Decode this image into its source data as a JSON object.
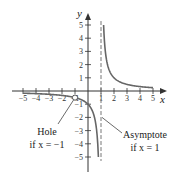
{
  "chart_data": {
    "type": "line",
    "title": "",
    "xlabel": "x",
    "ylabel": "y",
    "xlim": [
      -5.5,
      5.5
    ],
    "ylim": [
      -5.5,
      5.5
    ],
    "x_ticks": [
      -5,
      -4,
      -3,
      -2,
      -1,
      1,
      2,
      3,
      4,
      5
    ],
    "x_tick_labels": [
      "−5",
      "−4",
      "−3",
      "−2",
      "−1",
      "1",
      "2",
      "3",
      "4",
      "5"
    ],
    "y_ticks": [
      -5,
      -4,
      -3,
      -2,
      -1,
      1,
      2,
      3,
      4,
      5
    ],
    "y_tick_labels": [
      "−5",
      "−4",
      "−3",
      "−2",
      "−1",
      "1",
      "2",
      "3",
      "4",
      "5"
    ],
    "grid": false,
    "series": [
      {
        "name": "y = 1/(x − 1)",
        "branches": [
          {
            "x_range": [
              -5,
              0.8
            ],
            "note": "left branch, approaches −∞ as x → 1⁻"
          },
          {
            "x_range": [
              1.2,
              5
            ],
            "note": "right branch, approaches +∞ as x → 1⁺"
          }
        ]
      }
    ],
    "asymptote": {
      "x": 1,
      "style": "dashed"
    },
    "hole": {
      "x": -1,
      "y": -0.5
    },
    "annotations": [
      {
        "text_line1": "Hole",
        "text_line2": "if x = −1",
        "points_to": [
          -1,
          -0.5
        ]
      },
      {
        "text_line1": "Asymptote",
        "text_line2": "if x = 1",
        "points_to": [
          1,
          -2
        ]
      }
    ]
  },
  "labels": {
    "x_axis": "x",
    "y_axis": "y",
    "hole_line1": "Hole",
    "hole_line2": "if x = −1",
    "asym_line1": "Asymptote",
    "asym_line2": "if x = 1"
  }
}
